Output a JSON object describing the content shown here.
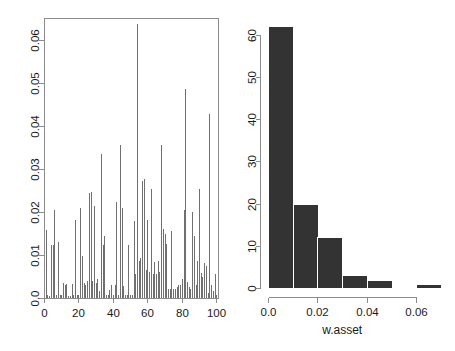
{
  "figure": {
    "background": "#ffffff",
    "panel_count": 2
  },
  "chart_data": [
    {
      "type": "bar",
      "name": "asset-weights-spike-plot",
      "title": "",
      "xlabel": "",
      "ylabel": "",
      "xlim": [
        0,
        101
      ],
      "ylim": [
        0,
        0.065
      ],
      "grid": false,
      "legend": null,
      "axis_style": "box-frame",
      "spike_color": "#707070",
      "xticks": [
        0,
        20,
        40,
        60,
        80,
        100
      ],
      "xtick_labels": [
        "0",
        "20",
        "40",
        "60",
        "80",
        "100"
      ],
      "yticks": [
        0.0,
        0.01,
        0.02,
        0.03,
        0.04,
        0.05,
        0.06
      ],
      "ytick_labels": [
        "0.0",
        "0.01",
        "0.02",
        "0.03",
        "0.04",
        "0.05",
        "0.06"
      ],
      "x": [
        1,
        2,
        3,
        4,
        5,
        6,
        7,
        8,
        9,
        10,
        11,
        12,
        13,
        14,
        15,
        16,
        17,
        18,
        19,
        20,
        21,
        22,
        23,
        24,
        25,
        26,
        27,
        28,
        29,
        30,
        31,
        32,
        33,
        34,
        35,
        36,
        37,
        38,
        39,
        40,
        41,
        42,
        43,
        44,
        45,
        46,
        47,
        48,
        49,
        50,
        51,
        52,
        53,
        54,
        55,
        56,
        57,
        58,
        59,
        60,
        61,
        62,
        63,
        64,
        65,
        66,
        67,
        68,
        69,
        70,
        71,
        72,
        73,
        74,
        75,
        76,
        77,
        78,
        79,
        80,
        81,
        82,
        83,
        84,
        85,
        86,
        87,
        88,
        89,
        90,
        91,
        92,
        93,
        94,
        95,
        96,
        97,
        98,
        99,
        100
      ],
      "values": [
        0.0158,
        0.0008,
        0.0005,
        0.0122,
        0.0122,
        0.0205,
        0.0008,
        0.013,
        0.0008,
        0.0006,
        0.0034,
        0.003,
        0.0032,
        0.0005,
        0.0004,
        0.0032,
        0.0006,
        0.0182,
        0.0007,
        0.0006,
        0.0208,
        0.0098,
        0.0035,
        0.003,
        0.004,
        0.0243,
        0.0245,
        0.004,
        0.0213,
        0.0035,
        0.0043,
        0.0017,
        0.0334,
        0.0122,
        0.0145,
        0.0007,
        0.0006,
        0.0018,
        0.003,
        0.0006,
        0.003,
        0.0222,
        0.0006,
        0.0356,
        0.021,
        0.0028,
        0.0008,
        0.0008,
        0.0124,
        0.0006,
        0.0007,
        0.0178,
        0.0055,
        0.0635,
        0.0085,
        0.0092,
        0.0272,
        0.0277,
        0.0065,
        0.018,
        0.006,
        0.0254,
        0.0055,
        0.0083,
        0.0055,
        0.0085,
        0.006,
        0.0356,
        0.016,
        0.0148,
        0.0125,
        0.0022,
        0.002,
        0.0155,
        0.0022,
        0.002,
        0.0025,
        0.003,
        0.003,
        0.0045,
        0.0205,
        0.0485,
        0.0038,
        0.0026,
        0.0022,
        0.02,
        0.0145,
        0.003,
        0.0087,
        0.0254,
        0.0058,
        0.0048,
        0.0082,
        0.0074,
        0.0012,
        0.0426,
        0.003,
        0.0016,
        0.0055,
        0.0008
      ]
    },
    {
      "type": "bar",
      "name": "w-asset-histogram",
      "title": "",
      "xlabel": "w.asset",
      "ylabel": "",
      "xlim": [
        0.0,
        0.072
      ],
      "ylim": [
        0,
        63
      ],
      "grid": false,
      "legend": null,
      "axis_style": "separate-axes",
      "bar_color": "#333333",
      "bin_width": 0.01,
      "xticks": [
        0.0,
        0.02,
        0.04,
        0.06
      ],
      "xtick_labels": [
        "0.0",
        "0.02",
        "0.04",
        "0.06"
      ],
      "yticks": [
        0,
        10,
        20,
        30,
        40,
        50,
        60
      ],
      "ytick_labels": [
        "0",
        "10",
        "20",
        "30",
        "40",
        "50",
        "60"
      ],
      "bin_edges": [
        0.0,
        0.01,
        0.02,
        0.03,
        0.04,
        0.05,
        0.06,
        0.07
      ],
      "categories": [
        "0.00-0.01",
        "0.01-0.02",
        "0.02-0.03",
        "0.03-0.04",
        "0.04-0.05",
        "0.05-0.06",
        "0.06-0.07"
      ],
      "values": [
        62,
        20,
        12,
        3,
        2,
        0,
        1
      ]
    }
  ]
}
